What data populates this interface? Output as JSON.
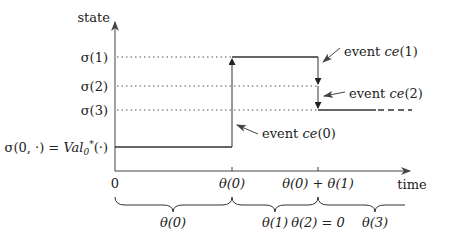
{
  "axes": {
    "y_label": "state",
    "x_label": "time"
  },
  "state_levels": [
    {
      "id": "sigma1",
      "label": "σ(1)"
    },
    {
      "id": "sigma2",
      "label": "σ(2)"
    },
    {
      "id": "sigma3",
      "label": "σ(3)"
    },
    {
      "id": "sigma0",
      "label_prefix": "σ(0, ·) = ",
      "label_val": "Val",
      "label_sub": "0",
      "label_sup": "*",
      "label_suffix": "(·)"
    }
  ],
  "x_ticks": [
    {
      "label": "0"
    },
    {
      "label": "θ(0)"
    },
    {
      "label": "θ(0) + θ(1)"
    }
  ],
  "events": [
    {
      "id": "ce0",
      "prefix": "event ",
      "name": "ce",
      "suffix": "(0)"
    },
    {
      "id": "ce1",
      "prefix": "event ",
      "name": "ce",
      "suffix": "(1)"
    },
    {
      "id": "ce2",
      "prefix": "event ",
      "name": "ce",
      "suffix": "(2)"
    }
  ],
  "durations": [
    {
      "label": "θ(0)"
    },
    {
      "label": "θ(1)"
    },
    {
      "label": "θ(2) = 0"
    },
    {
      "label": "θ(3)"
    }
  ],
  "colors": {
    "line": "#333333",
    "dotted": "#555555"
  }
}
